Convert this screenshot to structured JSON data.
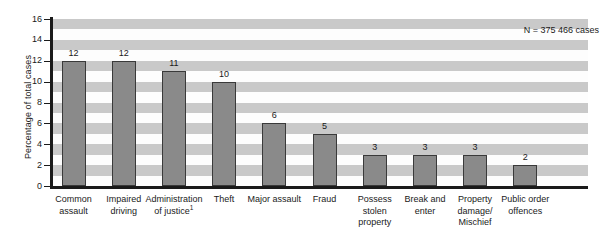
{
  "chart_data": {
    "type": "bar",
    "title": "",
    "subtitle": "",
    "xlabel": "",
    "ylabel": "Percentage of total cases",
    "ylim": [
      0,
      16
    ],
    "yticks": [
      0,
      2,
      4,
      6,
      8,
      10,
      12,
      14,
      16
    ],
    "grid": "alternating horizontal bands",
    "legend": "none",
    "annotations": [
      "N = 375 466 cases"
    ],
    "categories": [
      "Common assault",
      "Impaired driving",
      "Administration of justice¹",
      "Theft",
      "Major assault",
      "Fraud",
      "Possess stolen property",
      "Break and enter",
      "Property damage/ Mischief",
      "Public order offences"
    ],
    "category_lines": [
      [
        "Common",
        "assault"
      ],
      [
        "Impaired",
        "driving"
      ],
      [
        "Administration",
        "of justice"
      ],
      [
        "Theft"
      ],
      [
        "Major assault"
      ],
      [
        "Fraud"
      ],
      [
        "Possess",
        "stolen",
        "property"
      ],
      [
        "Break and",
        "enter"
      ],
      [
        "Property",
        "damage/",
        "Mischief"
      ],
      [
        "Public order",
        "offences"
      ]
    ],
    "values": [
      12,
      12,
      11,
      10,
      6,
      5,
      3,
      3,
      3,
      2
    ],
    "bar_labels": [
      "12",
      "12",
      "11",
      "10",
      "6",
      "5",
      "3",
      "3",
      "3",
      "2"
    ],
    "footnote_marker": "1",
    "colors": {
      "bar_fill": "#8a8a8a",
      "bar_border": "#3a3a3a",
      "axis": "#1a1a1a",
      "band_light": "#fdfdfd",
      "band_dark": "#c9c9c9",
      "text": "#1a1a1a",
      "background": "#ffffff"
    }
  },
  "axis": {
    "y_title": "Percentage of total cases",
    "tick_labels": [
      "0",
      "2",
      "4",
      "6",
      "8",
      "10",
      "12",
      "14",
      "16"
    ]
  },
  "annotation": {
    "sample_size": "N = 375 466 cases"
  }
}
